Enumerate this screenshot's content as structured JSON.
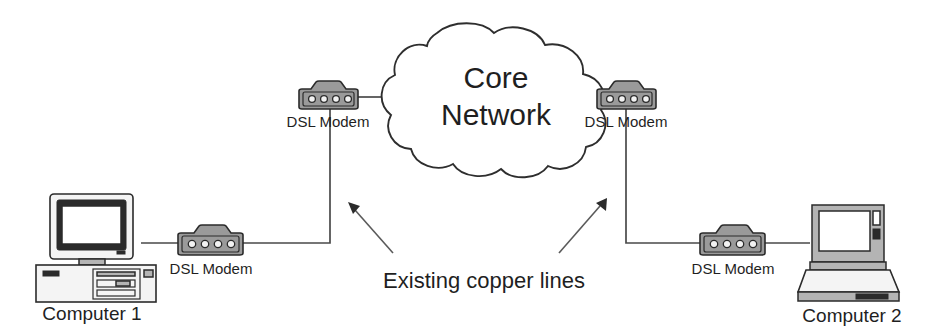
{
  "diagram": {
    "background_color": "#ffffff",
    "line_color": "#4a4a4a",
    "device_fill": "#9a9a9a",
    "text_color": "#1f1f1f"
  },
  "cloud": {
    "label_line1": "Core",
    "label_line2": "Network"
  },
  "nodes": {
    "computer1": {
      "label": "Computer 1",
      "type": "desktop-computer"
    },
    "computer2": {
      "label": "Computer 2",
      "type": "laptop-computer"
    }
  },
  "modems": [
    {
      "id": "modem-computer1",
      "label": "DSL Modem",
      "ports": 4
    },
    {
      "id": "modem-cloud-left",
      "label": "DSL Modem",
      "ports": 4
    },
    {
      "id": "modem-cloud-right",
      "label": "DSL Modem",
      "ports": 4
    },
    {
      "id": "modem-computer2",
      "label": "DSL Modem",
      "ports": 4
    }
  ],
  "annotations": {
    "copper_lines": "Existing copper lines"
  }
}
